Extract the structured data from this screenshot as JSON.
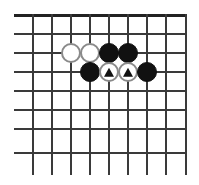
{
  "figure": {
    "kind": "go-board-diagram",
    "background_color": "#ffffff"
  },
  "board": {
    "visible_columns": 9,
    "visible_rows": 8,
    "cell_size": 19,
    "origin_x": 32,
    "origin_y": 14,
    "line_color": "#3a3a3a",
    "edge_color": "#222222",
    "top_edge_is_board_border": true,
    "h_line_overhang_left": 18,
    "v_line_overhang_bottom": 23,
    "h_lines_y": [
      14,
      33,
      52,
      71,
      90,
      109,
      128,
      152
    ],
    "v_lines_x": [
      32,
      51,
      70,
      89,
      108,
      127,
      146,
      165,
      185
    ]
  },
  "stones": [
    {
      "label": "white-stone-c3",
      "color": "white",
      "color_hex": "#ffffff",
      "outline_hex": "#8a8a8a",
      "col": 3,
      "row": 3,
      "x": 70,
      "y": 52,
      "marker": "none"
    },
    {
      "label": "white-stone-d3",
      "color": "white",
      "color_hex": "#ffffff",
      "outline_hex": "#8a8a8a",
      "col": 4,
      "row": 3,
      "x": 89,
      "y": 52,
      "marker": "none"
    },
    {
      "label": "black-stone-e3",
      "color": "black",
      "color_hex": "#111111",
      "outline_hex": "#111111",
      "col": 5,
      "row": 3,
      "x": 108,
      "y": 52,
      "marker": "none"
    },
    {
      "label": "black-stone-f3",
      "color": "black",
      "color_hex": "#111111",
      "outline_hex": "#111111",
      "col": 6,
      "row": 3,
      "x": 127,
      "y": 52,
      "marker": "none"
    },
    {
      "label": "black-stone-d4",
      "color": "black",
      "color_hex": "#111111",
      "outline_hex": "#111111",
      "col": 4,
      "row": 4,
      "x": 89,
      "y": 71,
      "marker": "none"
    },
    {
      "label": "white-stone-e4-marked",
      "color": "white",
      "color_hex": "#ffffff",
      "outline_hex": "#8a8a8a",
      "col": 5,
      "row": 4,
      "x": 108,
      "y": 71,
      "marker": "triangle"
    },
    {
      "label": "white-stone-f4-marked",
      "color": "white",
      "color_hex": "#ffffff",
      "outline_hex": "#8a8a8a",
      "col": 6,
      "row": 4,
      "x": 127,
      "y": 71,
      "marker": "triangle"
    },
    {
      "label": "black-stone-g4",
      "color": "black",
      "color_hex": "#111111",
      "outline_hex": "#111111",
      "col": 7,
      "row": 4,
      "x": 146,
      "y": 71,
      "marker": "none"
    }
  ],
  "markers": {
    "triangle_color": "#111111",
    "triangle_count": 2
  }
}
